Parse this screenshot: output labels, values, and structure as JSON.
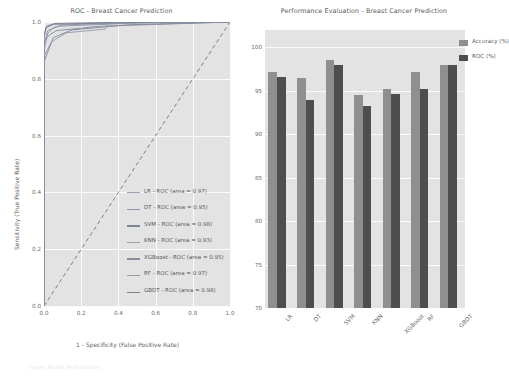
{
  "figure": {
    "background": "#ffffff",
    "axes_background": "#e3e3e3",
    "grid_color": "#fbfbfb"
  },
  "caption": "Figure: Model Performance",
  "chart_data": [
    {
      "type": "line",
      "id": "roc-curve-chart",
      "title": "ROC - Breast Cancer Prediction",
      "xlabel": "1 - Specificity (False Positive Rate)",
      "ylabel": "Sensitivity (True Positive Rate)",
      "xlim": [
        0.0,
        1.0
      ],
      "ylim": [
        0.0,
        1.0
      ],
      "xticks": [
        "0.0",
        "0.2",
        "0.4",
        "0.6",
        "0.8",
        "1.0"
      ],
      "yticks": [
        "0.0",
        "0.2",
        "0.4",
        "0.6",
        "0.8",
        "1.0"
      ],
      "grid": true,
      "legend_position": "lower right",
      "reference_line": {
        "label": "chance-diagonal",
        "style": "dashed",
        "color": "#7d7d8a"
      },
      "series": [
        {
          "name": "LR - ROC (area = 0.97)",
          "model": "LR",
          "auc": 0.97,
          "color": "#9aa0b4",
          "points": [
            [
              0.0,
              0.0
            ],
            [
              0.0,
              0.9
            ],
            [
              0.02,
              0.96
            ],
            [
              0.05,
              0.98
            ],
            [
              0.1,
              0.99
            ],
            [
              0.4,
              0.995
            ],
            [
              1.0,
              1.0
            ]
          ]
        },
        {
          "name": "DT - ROC (area = 0.95)",
          "model": "DT",
          "auc": 0.95,
          "color": "#8d93a8",
          "points": [
            [
              0.0,
              0.0
            ],
            [
              0.0,
              0.93
            ],
            [
              0.03,
              0.955
            ],
            [
              0.07,
              0.97
            ],
            [
              0.3,
              0.985
            ],
            [
              1.0,
              1.0
            ]
          ]
        },
        {
          "name": "SVM - ROC (area = 0.98)",
          "model": "SVM",
          "auc": 0.98,
          "color": "#7f8598",
          "points": [
            [
              0.0,
              0.0
            ],
            [
              0.0,
              0.955
            ],
            [
              0.015,
              0.985
            ],
            [
              0.06,
              0.995
            ],
            [
              0.5,
              1.0
            ],
            [
              1.0,
              1.0
            ]
          ]
        },
        {
          "name": "KNN - ROC (area = 0.93)",
          "model": "KNN",
          "auc": 0.93,
          "color": "#9ba1b2",
          "points": [
            [
              0.0,
              0.0
            ],
            [
              0.0,
              0.88
            ],
            [
              0.04,
              0.93
            ],
            [
              0.12,
              0.962
            ],
            [
              0.33,
              0.975
            ],
            [
              0.35,
              1.0
            ],
            [
              1.0,
              1.0
            ]
          ]
        },
        {
          "name": "XGBoost - ROC (area = 0.95)",
          "model": "XGBoost",
          "auc": 0.95,
          "color": "#888e9f",
          "points": [
            [
              0.0,
              0.0
            ],
            [
              0.0,
              0.86
            ],
            [
              0.05,
              0.945
            ],
            [
              0.15,
              0.972
            ],
            [
              0.45,
              0.99
            ],
            [
              1.0,
              1.0
            ]
          ]
        },
        {
          "name": "RF - ROC (area = 0.97)",
          "model": "RF",
          "auc": 0.97,
          "color": "#959bad",
          "points": [
            [
              0.0,
              0.0
            ],
            [
              0.0,
              0.92
            ],
            [
              0.02,
              0.97
            ],
            [
              0.08,
              0.985
            ],
            [
              0.55,
              0.998
            ],
            [
              1.0,
              1.0
            ]
          ]
        },
        {
          "name": "GBDT - ROC (area = 0.98)",
          "model": "GBDT",
          "auc": 0.98,
          "color": "#7b8193",
          "points": [
            [
              0.0,
              0.0
            ],
            [
              0.0,
              0.945
            ],
            [
              0.01,
              0.98
            ],
            [
              0.05,
              0.992
            ],
            [
              0.6,
              1.0
            ],
            [
              1.0,
              1.0
            ]
          ]
        }
      ]
    },
    {
      "type": "bar",
      "id": "performance-bar-chart",
      "title": "Performance Evaluation - Breast Cancer Prediction",
      "xlabel": "",
      "ylabel": "",
      "categories": [
        "LR",
        "DT",
        "SVM",
        "KNN",
        "XGBoost",
        "RF",
        "GBDT"
      ],
      "ylim": [
        70,
        102
      ],
      "yticks": [
        "70",
        "75",
        "80",
        "85",
        "90",
        "95",
        "100"
      ],
      "grid": true,
      "legend_position": "upper right",
      "series": [
        {
          "name": "Accuracy (%)",
          "color": "#8f8f8f",
          "values": [
            97.2,
            96.5,
            98.5,
            94.5,
            95.2,
            97.2,
            98.0
          ]
        },
        {
          "name": "ROC (%)",
          "color": "#4e4e4e",
          "values": [
            96.6,
            94.0,
            98.0,
            93.3,
            94.6,
            95.2,
            98.0
          ]
        }
      ]
    }
  ]
}
